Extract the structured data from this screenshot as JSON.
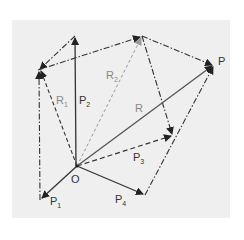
{
  "diagram": {
    "type": "vector-polygon-addition",
    "background_color": "#efefef",
    "line_color": "#333333",
    "light_line_color": "#999999",
    "points": {
      "O": [
        77,
        166
      ],
      "P1": [
        40,
        200
      ],
      "P2": [
        75,
        36
      ],
      "V1": [
        38,
        70
      ],
      "V2": [
        142,
        36
      ],
      "P": [
        214,
        65
      ],
      "P3": [
        173,
        136
      ],
      "P4": [
        145,
        195
      ]
    },
    "labels": {
      "origin": "O",
      "p": "P",
      "r": "R",
      "p1": "P",
      "p1_sub": "1",
      "p2": "P",
      "p2_sub": "2",
      "p3": "P",
      "p3_sub": "3",
      "p4": "P",
      "p4_sub": "4",
      "r1": "R",
      "r1_sub": "1",
      "r2": "R",
      "r2_sub": "2"
    },
    "vectors": [
      {
        "name": "P1",
        "from": "O",
        "to": "P1",
        "style": "solid"
      },
      {
        "name": "P2",
        "from": "O",
        "to": "P2",
        "style": "solid"
      },
      {
        "name": "P3",
        "from": "O",
        "to": "P3",
        "style": "dashed"
      },
      {
        "name": "P4",
        "from": "O",
        "to": "P4",
        "style": "solid"
      },
      {
        "name": "R",
        "from": "O",
        "to": "P",
        "style": "solid"
      },
      {
        "name": "R1",
        "from": "O",
        "to": "V1",
        "style": "dashed"
      },
      {
        "name": "R2",
        "from": "O",
        "to": "V2",
        "style": "light-dashed"
      }
    ]
  }
}
